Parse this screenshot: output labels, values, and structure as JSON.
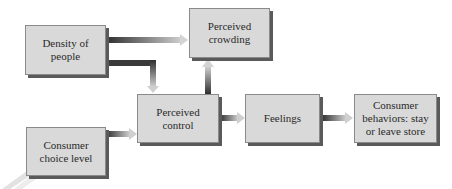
{
  "diagram": {
    "type": "flowchart",
    "nodes": [
      {
        "id": "density",
        "label": "Density of people",
        "lines": [
          "Density of",
          "people"
        ]
      },
      {
        "id": "crowding",
        "label": "Perceived crowding",
        "lines": [
          "Perceived",
          "crowding"
        ]
      },
      {
        "id": "control",
        "label": "Perceived control",
        "lines": [
          "Perceived",
          "control"
        ]
      },
      {
        "id": "feelings",
        "label": "Feelings",
        "lines": [
          "Feelings"
        ]
      },
      {
        "id": "behaviors",
        "label": "Consumer behaviors: stay or leave store",
        "lines": [
          "Consumer",
          "behaviors: stay",
          "or leave store"
        ]
      },
      {
        "id": "choice",
        "label": "Consumer choice level",
        "lines": [
          "Consumer",
          "choice level"
        ]
      }
    ],
    "edges": [
      {
        "from": "density",
        "to": "crowding"
      },
      {
        "from": "density",
        "to": "control"
      },
      {
        "from": "control",
        "to": "crowding"
      },
      {
        "from": "control",
        "to": "feelings"
      },
      {
        "from": "feelings",
        "to": "behaviors"
      },
      {
        "from": "choice",
        "to": "control"
      }
    ],
    "colors": {
      "box_fill": "#d9d9d9",
      "box_border": "#8a8a8a",
      "box_shadow": "#5a5a5a",
      "text": "#2a2a2a",
      "arrow_dark": "#3a3a3a",
      "arrow_light": "#d0d0d0"
    }
  }
}
